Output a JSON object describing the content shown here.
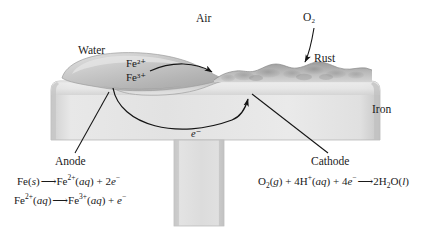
{
  "diagram": {
    "region_labels": {
      "air": "Air",
      "water": "Water",
      "rust": "Rust",
      "iron": "Iron",
      "oxygen": "O₂"
    },
    "species_in_droplet": {
      "ferrous": "Fe²⁺",
      "ferric": "Fe³⁺"
    },
    "electron_flow_label": "e⁻",
    "electrodes": {
      "anode_label": "Anode",
      "cathode_label": "Cathode"
    },
    "equations": {
      "anode_1": {
        "reactant": "Fe(s)",
        "arrow": "→",
        "product": "Fe²⁺(aq) + 2e⁻",
        "full": "Fe(s) → Fe²⁺(aq) + 2e⁻"
      },
      "anode_2": {
        "reactant": "Fe²⁺(aq)",
        "arrow": "→",
        "product": "Fe³⁺(aq) + e⁻",
        "full": "Fe²⁺(aq) → Fe³⁺(aq) + e⁻"
      },
      "cathode_1": {
        "reactant": "O₂(g) + 4H⁺(aq) + 4e⁻",
        "arrow": "→",
        "product": "2H₂O(l)",
        "full": "O₂(g) + 4H⁺(aq) + 4e⁻ → 2H₂O(l)"
      }
    },
    "colors": {
      "background": "#ffffff",
      "iron_light": "#efefef",
      "iron_mid": "#d8d8d8",
      "iron_dark": "#b9b9b9",
      "water_light": "#d6d6d6",
      "water_dark": "#a9a9a9",
      "rust_light": "#cfcfcf",
      "rust_dark": "#8f8f8f",
      "ink": "#1a1a1a"
    }
  }
}
